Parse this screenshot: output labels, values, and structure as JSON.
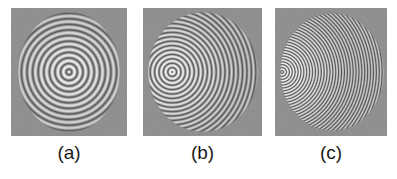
{
  "figure": {
    "type": "scientific-figure-interferograms",
    "width": 397,
    "height": 179,
    "page_background": "#ffffff",
    "panel_background": "#8d8d8d",
    "label_color": "#1a1a1a",
    "fringe_bright": "#fbfbfb",
    "fringe_dark": "#5c5c5c",
    "caption_font_size": 19
  },
  "panels": [
    {
      "id": "panel-a",
      "label": "(a)",
      "x": 11,
      "y": 8,
      "width": 116,
      "height": 128,
      "disk": {
        "cx": 58,
        "cy": 64,
        "rx": 51,
        "ry": 60
      },
      "fringes": {
        "center_x_fraction": 0.5,
        "center_y_fraction": 0.5,
        "center_state": "bright",
        "ring_count": 10,
        "ring_period_px": 5.6,
        "first_ring_radius_px": 12,
        "density": "low",
        "description": "concentric circular fringes centered on the aperture, broad bright central spot"
      }
    },
    {
      "id": "panel-b",
      "label": "(b)",
      "x": 143,
      "y": 8,
      "width": 119,
      "height": 128,
      "disk": {
        "cx": 60,
        "cy": 64,
        "rx": 55,
        "ry": 60
      },
      "fringes": {
        "center_x_fraction": 0.22,
        "center_y_fraction": 0.5,
        "center_state": "dark",
        "ring_count": 20,
        "ring_period_px": 4.4,
        "first_ring_radius_px": 7,
        "density": "medium",
        "description": "ring centre displaced toward the left of the aperture producing crescent fringes that crowd on the right"
      }
    },
    {
      "id": "panel-c",
      "label": "(c)",
      "x": 275,
      "y": 8,
      "width": 112,
      "height": 128,
      "disk": {
        "cx": 57,
        "cy": 64,
        "rx": 52,
        "ry": 59
      },
      "fringes": {
        "center_x_fraction": 0.02,
        "center_y_fraction": 0.5,
        "center_state": "bright",
        "ring_count": 36,
        "ring_period_px": 2.9,
        "first_ring_radius_px": 3,
        "density": "high",
        "description": "ring centre at the extreme left edge of the aperture giving very fine, nearly vertical fringes across the whole disk"
      }
    }
  ],
  "chart_data": {
    "type": "heatmap",
    "title": "",
    "subtitle": "",
    "xlabel": "",
    "ylabel": "",
    "legend": [],
    "grid": false,
    "panel_labels": [
      "(a)",
      "(b)",
      "(c)"
    ],
    "series": [
      {
        "name": "(a)",
        "center_offset_fraction": 0.0,
        "fringe_count": 10,
        "center_intensity": "bright"
      },
      {
        "name": "(b)",
        "center_offset_fraction": 0.28,
        "fringe_count": 20,
        "center_intensity": "dark"
      },
      {
        "name": "(c)",
        "center_offset_fraction": 0.48,
        "fringe_count": 36,
        "center_intensity": "bright"
      }
    ]
  }
}
